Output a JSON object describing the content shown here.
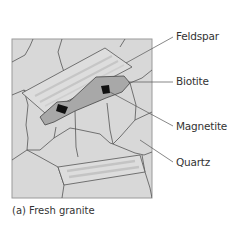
{
  "diagram": {
    "caption": "(a) Fresh granite",
    "labels": {
      "feldspar": "Feldspar",
      "biotite": "Biotite",
      "magnetite": "Magnetite",
      "quartz": "Quartz"
    },
    "colors": {
      "background": "#d8d8d8",
      "grain_border": "#555555",
      "biotite_fill": "#a9a9a9",
      "magnetite_fill": "#111111",
      "feldspar_fill": "#dcdcdc",
      "feldspar_stripe": "#c4c4c4"
    }
  }
}
